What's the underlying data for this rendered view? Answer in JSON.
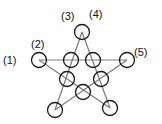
{
  "diagram": {
    "type": "pentagram-with-node-circles",
    "colors": {
      "line": "#7a7a7a",
      "circle": "#1a1a1a",
      "background": "#ffffff"
    },
    "outer_nodes": [
      {
        "id": "left",
        "x": 39,
        "y": 60
      },
      {
        "id": "top",
        "x": 82,
        "y": 32
      },
      {
        "id": "right",
        "x": 127,
        "y": 60
      },
      {
        "id": "bottom-left",
        "x": 55,
        "y": 110
      },
      {
        "id": "bottom-right",
        "x": 110,
        "y": 108
      }
    ],
    "inner_nodes": [
      {
        "id": "inner-top-left",
        "x": 71,
        "y": 60
      },
      {
        "id": "inner-top-right",
        "x": 93,
        "y": 60
      },
      {
        "id": "inner-mid-left",
        "x": 67,
        "y": 79
      },
      {
        "id": "inner-mid-right",
        "x": 101,
        "y": 79
      },
      {
        "id": "inner-bottom",
        "x": 83,
        "y": 92
      }
    ],
    "labels": [
      {
        "text": "(1)",
        "x": 3,
        "y": 55
      },
      {
        "text": "(2)",
        "x": 31,
        "y": 39
      },
      {
        "text": "(3)",
        "x": 61,
        "y": 11
      },
      {
        "text": "(4)",
        "x": 89,
        "y": 9
      },
      {
        "text": "(5)",
        "x": 134,
        "y": 47
      }
    ]
  }
}
